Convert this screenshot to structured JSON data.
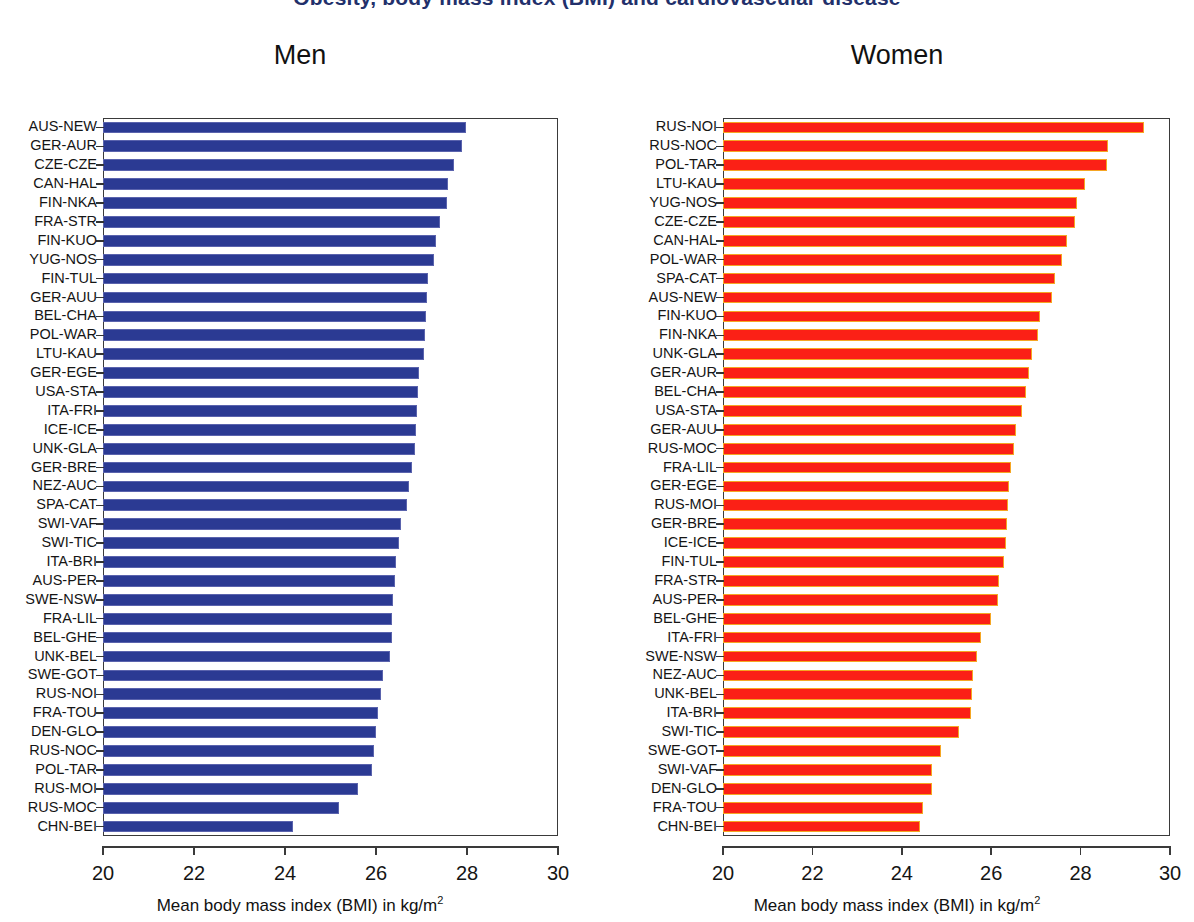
{
  "figure": {
    "title": "Obesity, body mass index (BMI) and cardiovascular disease",
    "title_clipped": true
  },
  "panels": [
    {
      "key": "men",
      "title": "Men",
      "color": "#2b3a93",
      "edge_color": "#5a63ad",
      "xaxis_title_main": "Mean body mass index (BMI) in kg/m",
      "xaxis_title_sup": "2"
    },
    {
      "key": "women",
      "title": "Women",
      "color": "#fb2016",
      "edge_color": "#f5a623",
      "xaxis_title_main": "Mean body mass index (BMI) in kg/m",
      "xaxis_title_sup": "2"
    }
  ],
  "axis": {
    "ticks": [
      "20",
      "22",
      "24",
      "26",
      "28",
      "30"
    ],
    "min": 20,
    "max": 30
  },
  "chart_data": [
    {
      "type": "bar",
      "orientation": "horizontal",
      "title": "Men",
      "xlabel": "Mean body mass index (BMI) in kg/m2",
      "ylabel": "",
      "xlim": [
        20,
        30
      ],
      "xticks": [
        20,
        22,
        24,
        26,
        28,
        30
      ],
      "grid": false,
      "legend": "none",
      "color": "#2b3a93",
      "categories": [
        "AUS-NEW",
        "GER-AUR",
        "CZE-CZE",
        "CAN-HAL",
        "FIN-NKA",
        "FRA-STR",
        "FIN-KUO",
        "YUG-NOS",
        "FIN-TUL",
        "GER-AUU",
        "BEL-CHA",
        "POL-WAR",
        "LTU-KAU",
        "GER-EGE",
        "USA-STA",
        "ITA-FRI",
        "ICE-ICE",
        "UNK-GLA",
        "GER-BRE",
        "NEZ-AUC",
        "SPA-CAT",
        "SWI-VAF",
        "SWI-TIC",
        "ITA-BRI",
        "AUS-PER",
        "SWE-NSW",
        "FRA-LIL",
        "BEL-GHE",
        "UNK-BEL",
        "SWE-GOT",
        "RUS-NOI",
        "FRA-TOU",
        "DEN-GLO",
        "RUS-NOC",
        "POL-TAR",
        "RUS-MOI",
        "RUS-MOC",
        "CHN-BEI"
      ],
      "values": [
        27.98,
        27.88,
        27.72,
        27.58,
        27.55,
        27.4,
        27.32,
        27.28,
        27.15,
        27.13,
        27.1,
        27.08,
        27.05,
        26.95,
        26.92,
        26.9,
        26.88,
        26.85,
        26.8,
        26.72,
        26.68,
        26.55,
        26.5,
        26.45,
        26.42,
        26.38,
        26.35,
        26.35,
        26.3,
        26.15,
        26.1,
        26.05,
        26.0,
        25.95,
        25.92,
        25.6,
        25.18,
        24.18
      ]
    },
    {
      "type": "bar",
      "orientation": "horizontal",
      "title": "Women",
      "xlabel": "Mean body mass index (BMI) in kg/m2",
      "ylabel": "",
      "xlim": [
        20,
        30
      ],
      "xticks": [
        20,
        22,
        24,
        26,
        28,
        30
      ],
      "grid": false,
      "legend": "none",
      "color": "#fb2016",
      "categories": [
        "RUS-NOI",
        "RUS-NOC",
        "POL-TAR",
        "LTU-KAU",
        "YUG-NOS",
        "CZE-CZE",
        "CAN-HAL",
        "POL-WAR",
        "SPA-CAT",
        "AUS-NEW",
        "FIN-KUO",
        "FIN-NKA",
        "UNK-GLA",
        "GER-AUR",
        "BEL-CHA",
        "USA-STA",
        "GER-AUU",
        "RUS-MOC",
        "FRA-LIL",
        "GER-EGE",
        "RUS-MOI",
        "GER-BRE",
        "ICE-ICE",
        "FIN-TUL",
        "FRA-STR",
        "AUS-PER",
        "BEL-GHE",
        "ITA-FRI",
        "SWE-NSW",
        "NEZ-AUC",
        "UNK-BEL",
        "ITA-BRI",
        "SWI-TIC",
        "SWE-GOT",
        "SWI-VAF",
        "DEN-GLO",
        "FRA-TOU",
        "CHN-BEI"
      ],
      "values": [
        29.42,
        28.62,
        28.58,
        28.1,
        27.92,
        27.88,
        27.7,
        27.58,
        27.42,
        27.35,
        27.1,
        27.05,
        26.92,
        26.85,
        26.78,
        26.7,
        26.55,
        26.5,
        26.45,
        26.4,
        26.38,
        26.35,
        26.32,
        26.28,
        26.18,
        26.15,
        26.0,
        25.78,
        25.68,
        25.6,
        25.58,
        25.55,
        25.28,
        24.88,
        24.68,
        24.68,
        24.48,
        24.4
      ]
    }
  ]
}
